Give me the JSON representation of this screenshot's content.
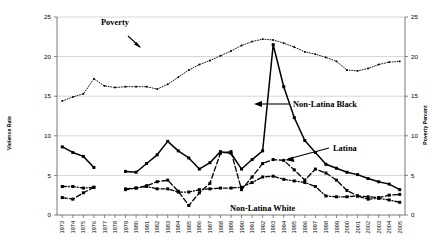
{
  "chart_data": {
    "type": "line",
    "title": "",
    "xlabel": "",
    "ylabel": "Violence Rate",
    "y2label": "Poverty Percent",
    "ylim": [
      0,
      25
    ],
    "y2lim": [
      0,
      25
    ],
    "yticks": [
      "0",
      "5",
      "10",
      "15",
      "20",
      "25"
    ],
    "y2ticks": [
      "0",
      "5",
      "10",
      "15",
      "20",
      "25"
    ],
    "grid": true,
    "legend_position": "inline-annotations",
    "categories": [
      "1973",
      "1974",
      "1975",
      "1976",
      "1977",
      "1978",
      "1979",
      "1980",
      "1981",
      "1982",
      "1983",
      "1984",
      "1985",
      "1986",
      "1987",
      "1988",
      "1989",
      "1990",
      "1991",
      "1992",
      "1993",
      "1994",
      "1995",
      "1996",
      "1997",
      "1998",
      "1999",
      "2000",
      "2001",
      "2002",
      "2003",
      "2004",
      "2005"
    ],
    "series": [
      {
        "name": "Poverty",
        "axis": "right",
        "style": "dotted",
        "values": [
          14.4,
          14.9,
          15.3,
          17.2,
          16.3,
          16.1,
          16.2,
          16.2,
          16.2,
          15.9,
          16.5,
          17.4,
          18.3,
          19.0,
          19.5,
          20.1,
          20.7,
          21.4,
          21.9,
          22.2,
          22.1,
          21.7,
          21.2,
          20.6,
          20.3,
          19.9,
          19.4,
          18.3,
          18.2,
          18.5,
          19.0,
          19.3,
          19.4
        ]
      },
      {
        "name": "Non-Latina Black",
        "axis": "left",
        "style": "solid",
        "values": [
          8.6,
          7.9,
          7.4,
          6.0,
          null,
          null,
          5.5,
          5.4,
          6.5,
          7.6,
          9.3,
          8.1,
          7.2,
          5.8,
          6.6,
          8.0,
          7.8,
          5.8,
          7.0,
          8.1,
          21.5,
          16.2,
          12.3,
          9.4,
          7.9,
          6.4,
          5.9,
          5.4,
          5.1,
          4.6,
          4.2,
          3.9,
          3.2
        ]
      },
      {
        "name": "Latina",
        "axis": "left",
        "style": "dashed",
        "values": [
          2.2,
          2.0,
          2.8,
          3.5,
          null,
          null,
          3.3,
          3.4,
          3.7,
          4.2,
          4.4,
          3.0,
          1.2,
          2.8,
          4.0,
          7.8,
          8.0,
          3.2,
          4.8,
          6.5,
          7.0,
          6.9,
          5.7,
          4.4,
          5.8,
          5.3,
          4.4,
          3.1,
          2.4,
          2.3,
          2.2,
          2.5,
          2.6
        ]
      },
      {
        "name": "Non-Latina White",
        "axis": "left",
        "style": "dash-dot",
        "values": [
          3.6,
          3.6,
          3.4,
          3.5,
          null,
          null,
          3.2,
          3.4,
          3.6,
          3.3,
          3.3,
          2.9,
          2.9,
          3.2,
          3.3,
          3.4,
          3.4,
          3.5,
          4.1,
          4.8,
          4.9,
          4.5,
          4.3,
          4.1,
          3.6,
          2.4,
          2.3,
          2.3,
          2.4,
          2.0,
          2.1,
          1.9,
          1.6
        ]
      }
    ],
    "annotations": [
      {
        "name": "Poverty",
        "label": "Poverty"
      },
      {
        "name": "Non-Latina Black",
        "label": "Non-Latina Black"
      },
      {
        "name": "Latina",
        "label": "Latina"
      },
      {
        "name": "Non-Latina White",
        "label": "Non-Latina White"
      }
    ]
  }
}
